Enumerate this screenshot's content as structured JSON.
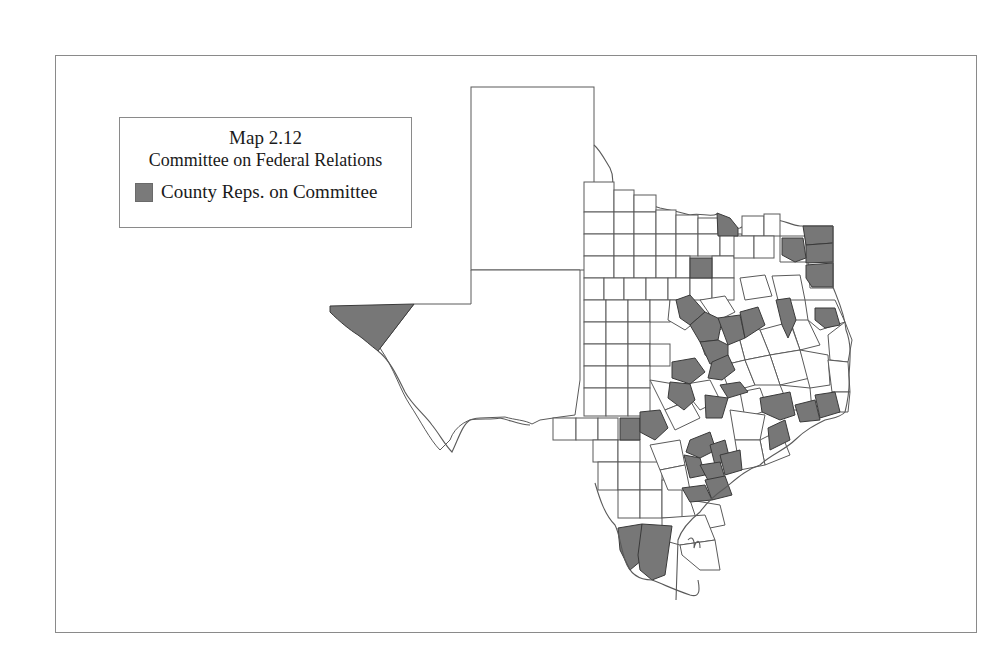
{
  "legend": {
    "title": "Map 2.12",
    "subtitle": "Committee on Federal Relations",
    "entries": [
      {
        "label": "County Reps. on Committee",
        "color": "#777777",
        "swatch": "shaded-square"
      }
    ]
  },
  "map": {
    "region": "Texas counties",
    "shaded_color": "#777777",
    "unshaded_color": "#ffffff",
    "border_color": "#5a5a5a"
  }
}
